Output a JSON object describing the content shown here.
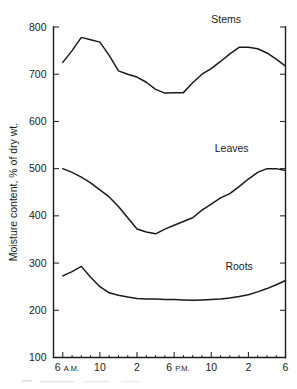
{
  "chart_data": {
    "type": "line",
    "title": "",
    "xlabel": "",
    "ylabel": "Moisture content, % of dry wt.",
    "ylim": [
      100,
      800
    ],
    "yticks": [
      100,
      200,
      300,
      400,
      500,
      600,
      700,
      800
    ],
    "ytick_labels": [
      "100",
      "200",
      "300",
      "400",
      "500",
      "600",
      "700",
      "800"
    ],
    "grid": false,
    "legend": "inline-labels",
    "xlim": [
      5,
      30
    ],
    "xticks": [
      6,
      10,
      14,
      18,
      22,
      26,
      30
    ],
    "xtick_labels": [
      "6",
      "10",
      "2",
      "6",
      "10",
      "2",
      "6"
    ],
    "xtick_suffixes": [
      "A.M.",
      "",
      "",
      "P.M.",
      "",
      "",
      ""
    ],
    "xtick_minor": [
      7,
      8,
      9,
      11,
      12,
      13,
      15,
      16,
      17,
      19,
      20,
      21,
      23,
      24,
      25,
      27,
      28,
      29
    ],
    "x": [
      6,
      7,
      8,
      9,
      10,
      11,
      12,
      13,
      14,
      15,
      16,
      17,
      18,
      19,
      20,
      21,
      22,
      23,
      24,
      25,
      26,
      27,
      28,
      29,
      30
    ],
    "series": [
      {
        "name": "Stems",
        "label": "Stems",
        "label_x": 23.6,
        "label_y": 808,
        "values": [
          725,
          750,
          778,
          773,
          768,
          740,
          707,
          700,
          694,
          683,
          668,
          660,
          661,
          661,
          682,
          700,
          712,
          727,
          743,
          757,
          757,
          754,
          745,
          732,
          717
        ]
      },
      {
        "name": "Leaves",
        "label": "Leaves",
        "label_x": 24.2,
        "label_y": 535,
        "values": [
          500,
          492,
          482,
          470,
          455,
          440,
          420,
          396,
          372,
          366,
          362,
          372,
          380,
          388,
          396,
          412,
          425,
          438,
          447,
          462,
          478,
          492,
          500,
          500,
          496
        ]
      },
      {
        "name": "Roots",
        "label": "Roots",
        "label_x": 25.0,
        "label_y": 285,
        "values": [
          273,
          282,
          293,
          270,
          250,
          237,
          232,
          228,
          225,
          224,
          224,
          223,
          223,
          222,
          221,
          222,
          223,
          224,
          226,
          229,
          233,
          239,
          246,
          254,
          263
        ]
      }
    ]
  },
  "figure": {
    "y_axis_title": "Moisture content, % of dry wt."
  }
}
